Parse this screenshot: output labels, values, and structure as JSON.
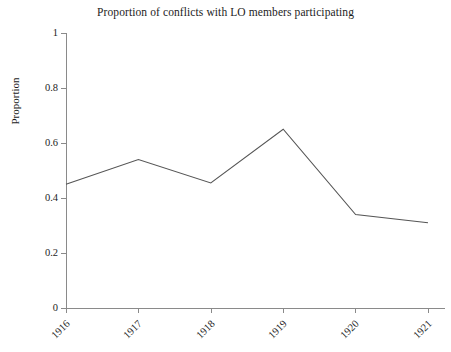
{
  "chart_data": {
    "type": "line",
    "title": "Proportion of conflicts with LO members participating",
    "xlabel": "",
    "ylabel": "Proportion",
    "categories": [
      "1916",
      "1917",
      "1918",
      "1919",
      "1920",
      "1921"
    ],
    "x": [
      1916,
      1917,
      1918,
      1919,
      1920,
      1921
    ],
    "values": [
      0.45,
      0.54,
      0.455,
      0.65,
      0.34,
      0.31
    ],
    "series": [
      {
        "name": "Proportion",
        "values": [
          0.45,
          0.54,
          0.455,
          0.65,
          0.34,
          0.31
        ],
        "color": "#555555"
      }
    ],
    "ylim": [
      0,
      1
    ],
    "yticks": [
      0,
      0.2,
      0.4,
      0.6,
      0.8,
      1
    ],
    "ytick_labels": [
      "0",
      "0.2",
      "0.4",
      "0.6",
      "0.8",
      "1"
    ],
    "xtick_labels": [
      "1916",
      "1917",
      "1918",
      "1919",
      "1920",
      "1921"
    ],
    "grid": false,
    "legend": false,
    "legend_position": "none",
    "markers": false,
    "xtick_label_rotation": -45,
    "background_color": "#ffffff",
    "axis_color": "#8a8a8a",
    "text_color": "#1c1c1c"
  }
}
